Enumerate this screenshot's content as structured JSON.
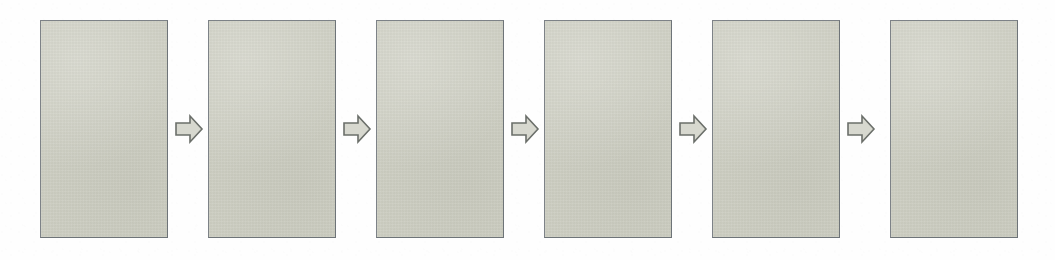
{
  "diagram": {
    "type": "linear-process-flow",
    "background_color": "#fefefe",
    "stage_count": 6,
    "connector_count": 5,
    "panel": {
      "fill_color": "#cdcec2",
      "border_color": "#7d8287",
      "width_px": 128,
      "height_px": 218,
      "top_px": 20
    },
    "connector": {
      "shape": "block-arrow-right",
      "fill_color": "#d7d8cf",
      "outline_color": "#6b6f6a",
      "direction": "right",
      "width_px": 30,
      "height_px": 34,
      "top_px": 112
    },
    "stages": [
      {
        "index": 1,
        "label": "",
        "x_px": 40,
        "ghost_text": "",
        "ghost_level": "ghost-none"
      },
      {
        "index": 2,
        "label": "",
        "x_px": 208,
        "ghost_text": "",
        "ghost_level": "ghost-faint"
      },
      {
        "index": 3,
        "label": "",
        "x_px": 376,
        "ghost_text": "",
        "ghost_level": "ghost-faint"
      },
      {
        "index": 4,
        "label": "",
        "x_px": 544,
        "ghost_text": "",
        "ghost_level": "ghost-faint"
      },
      {
        "index": 5,
        "label": "",
        "x_px": 712,
        "ghost_text": "",
        "ghost_level": "ghost-faint"
      },
      {
        "index": 6,
        "label": "",
        "x_px": 890,
        "ghost_text": "",
        "ghost_level": "ghost-soft"
      }
    ],
    "connectors": [
      {
        "index": 1,
        "label": "",
        "x_px": 174
      },
      {
        "index": 2,
        "label": "",
        "x_px": 342
      },
      {
        "index": 3,
        "label": "",
        "x_px": 510
      },
      {
        "index": 4,
        "label": "",
        "x_px": 678
      },
      {
        "index": 5,
        "label": "",
        "x_px": 846
      }
    ]
  }
}
